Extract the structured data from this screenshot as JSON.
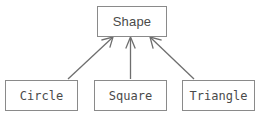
{
  "diagram": {
    "type": "uml-class-inheritance",
    "width": 261,
    "height": 127,
    "background_color": "#ffffff",
    "line_color": "#8a8a8a",
    "text_color": "#4a4a4a",
    "parent": {
      "id": "shape",
      "label": "Shape"
    },
    "children": [
      {
        "id": "circle",
        "label": "Circle"
      },
      {
        "id": "square",
        "label": "Square"
      },
      {
        "id": "triangle",
        "label": "Triangle"
      }
    ],
    "connectors": [
      {
        "id": "circle-to-shape",
        "from": "circle",
        "to": "shape",
        "arrow": "open-v",
        "direction": "up-right"
      },
      {
        "id": "square-to-shape",
        "from": "square",
        "to": "shape",
        "arrow": "open-v",
        "direction": "up"
      },
      {
        "id": "triangle-to-shape",
        "from": "triangle",
        "to": "shape",
        "arrow": "open-v",
        "direction": "up-left"
      }
    ]
  }
}
